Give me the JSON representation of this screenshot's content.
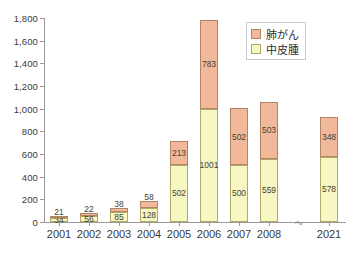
{
  "chart_data": {
    "type": "bar",
    "stacked": true,
    "title": "",
    "xlabel": "",
    "ylabel": "",
    "ylim": [
      0,
      1800
    ],
    "ytick_step": 200,
    "grid": false,
    "legend_position": "top-right",
    "axis_break": {
      "present": true,
      "between": [
        "2008",
        "2021"
      ],
      "marker": "〜"
    },
    "categories": [
      "2001",
      "2002",
      "2003",
      "2004",
      "2005",
      "2006",
      "2007",
      "2008",
      "2021"
    ],
    "ytick_labels": [
      "0",
      "200",
      "400",
      "600",
      "800",
      "1,000",
      "1,200",
      "1,400",
      "1,600",
      "1,800"
    ],
    "ytick_values": [
      0,
      200,
      400,
      600,
      800,
      1000,
      1200,
      1400,
      1600,
      1800
    ],
    "series": [
      {
        "name": "中皮腫",
        "key": "meso",
        "color": "#f7f7c4",
        "border": "#b0a96a",
        "values": [
          34,
          56,
          85,
          128,
          502,
          1001,
          500,
          559,
          578
        ],
        "labels": [
          "34",
          "56",
          "85",
          "128",
          "502",
          "1001",
          "500",
          "559",
          "578"
        ]
      },
      {
        "name": "肺がん",
        "key": "lung",
        "color": "#f2b89a",
        "border": "#b08565",
        "values": [
          21,
          22,
          38,
          58,
          213,
          783,
          502,
          503,
          348
        ],
        "labels": [
          "21",
          "22",
          "38",
          "58",
          "213",
          "783",
          "502",
          "503",
          "348"
        ]
      }
    ],
    "totals": [
      55,
      78,
      123,
      186,
      715,
      1784,
      1002,
      1062,
      926
    ],
    "legend": [
      {
        "label": "肺がん",
        "key": "lung"
      },
      {
        "label": "中皮腫",
        "key": "meso"
      }
    ]
  }
}
